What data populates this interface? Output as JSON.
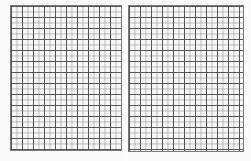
{
  "document": {
    "type": "scanned graph paper spread",
    "pages": [
      {
        "name": "left-page",
        "content": "blank grid"
      },
      {
        "name": "right-page",
        "content": "blank grid"
      }
    ]
  },
  "colors": {
    "background": "#f4f4f4",
    "grid_major": "#464646",
    "grid_minor": "#8c8c8c"
  }
}
